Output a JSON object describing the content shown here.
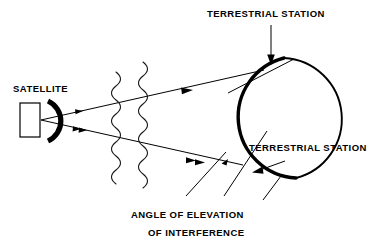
{
  "figure": {
    "background_color": "#ffffff",
    "line_color": "#000000",
    "width": 378,
    "height": 249
  },
  "labels": {
    "satellite": "SATELLITE",
    "terrestrial_station_top": "TERRESTRIAL STATION",
    "terrestrial_station_right": "TERRESTRIAL STATION",
    "angle_line1": "ANGLE OF ELEVATION",
    "angle_line2": "OF INTERFERENCE"
  },
  "elements": {
    "satellite_body": "satellite-body-rectangle",
    "satellite_dish": "satellite-dish-antenna",
    "earth": "earth-circle",
    "wave_left": "interference-wavefront-left",
    "wave_right": "interference-wavefront-right",
    "ray_upper": "beam-ray-upper",
    "ray_lower": "beam-ray-lower",
    "tangent_upper": "horizon-tangent-upper",
    "tangent_lower": "horizon-tangent-lower",
    "callout_top": "callout-arrow-top-station",
    "callout_right": "callout-arrow-right-station",
    "leader_angle_a": "leader-line-angle-a",
    "leader_angle_b": "leader-line-angle-b"
  }
}
